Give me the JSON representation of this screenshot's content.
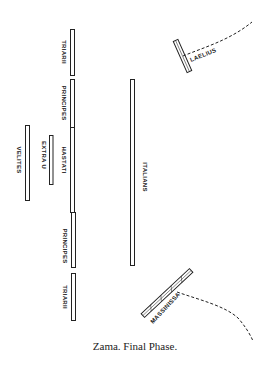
{
  "diagram": {
    "caption": "Zama.   Final Phase.",
    "colors": {
      "ink": "#222222",
      "paper": "#ffffff"
    },
    "units": {
      "triarii_top": {
        "label": "TRIARII"
      },
      "principes_top": {
        "label": "PRINCIPES"
      },
      "hastati": {
        "label": "HASTATI"
      },
      "principes_bottom": {
        "label": "PRINCIPES"
      },
      "triarii_bottom": {
        "label": "TRIARII"
      },
      "velites": {
        "label": "VELITES"
      },
      "extra_u": {
        "label": "EXTRA U"
      },
      "italians": {
        "label": "ITALIANS"
      },
      "laelius": {
        "label": "LAELIUS"
      },
      "massinissa": {
        "label": "MASSINISSA"
      }
    }
  }
}
